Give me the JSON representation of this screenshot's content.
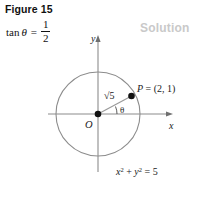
{
  "figure": {
    "caption": "Figure 15",
    "solution_label": "Solution"
  },
  "given": {
    "function_name": "tan",
    "variable": "θ",
    "equals": "=",
    "numerator": "1",
    "denominator": "2",
    "full_text": "tan θ = 1/2"
  },
  "diagram": {
    "axis_x_label": "x",
    "axis_y_label": "y",
    "origin_label": "O",
    "point_label": "P = (2, 1)",
    "radius_label": "√5",
    "angle_label": "θ",
    "circle_equation": "x² + y² = 5",
    "circle_equation_parts": {
      "x": "x",
      "x_exp": "2",
      "plus": "+",
      "y": "y",
      "y_exp": "2",
      "equals": "=",
      "value": "5"
    },
    "point_coords": {
      "x": 2,
      "y": 1
    },
    "radius_value": "√5",
    "circle_radius_squared": 5
  },
  "colors": {
    "axis": "#8c8c8c",
    "circle": "#8c8c8c",
    "radius_line": "#9a9a9a",
    "point_fill": "#111111",
    "text": "#1a1a1a",
    "watermark": "#c9c9c9",
    "background": "#ffffff"
  }
}
